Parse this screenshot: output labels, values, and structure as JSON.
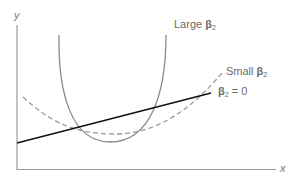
{
  "diagram": {
    "axes": {
      "x_label": "x",
      "y_label": "y"
    },
    "curves": [
      {
        "name": "Large β2",
        "style": "solid-gray",
        "color": "#8a8a8a",
        "prefix": "Large ",
        "beta": "β",
        "sub": "2",
        "suffix": ""
      },
      {
        "name": "Small β2",
        "style": "dashed-gray",
        "color": "#9a9a9a",
        "prefix": "Small ",
        "beta": "β",
        "sub": "2",
        "suffix": ""
      },
      {
        "name": "β2 = 0",
        "style": "solid-black",
        "color": "#111111",
        "prefix": "",
        "beta": "β",
        "sub": "2",
        "suffix": " = 0"
      }
    ]
  }
}
